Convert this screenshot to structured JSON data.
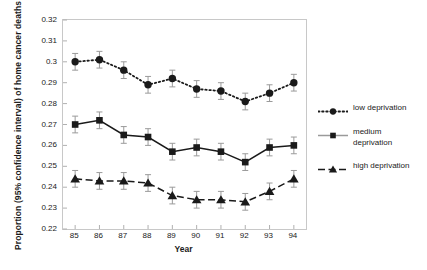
{
  "chart_data": {
    "type": "line",
    "title": "",
    "xlabel": "Year",
    "ylabel": "Proportion (95% confidence interval) of home cancer deaths",
    "categories": [
      "85",
      "86",
      "87",
      "88",
      "89",
      "90",
      "91",
      "92",
      "93",
      "94"
    ],
    "x": [
      85,
      86,
      87,
      88,
      89,
      90,
      91,
      92,
      93,
      94
    ],
    "xlim": [
      84.5,
      94.5
    ],
    "ylim": [
      0.22,
      0.32
    ],
    "yticks": [
      "0.22",
      "0.23",
      "0.24",
      "0.25",
      "0.26",
      "0.27",
      "0.28",
      "0.29",
      "0.3",
      "0.31",
      "0.32"
    ],
    "ytick_values": [
      0.22,
      0.23,
      0.24,
      0.25,
      0.26,
      0.27,
      0.28,
      0.29,
      0.3,
      0.31,
      0.32
    ],
    "grid": false,
    "legend_position": "right",
    "error_bars": "95% confidence interval",
    "series": [
      {
        "name": "low deprivation",
        "marker": "circle",
        "line_style": "dotted",
        "color": "#1a1a1a",
        "values": [
          0.3,
          0.301,
          0.296,
          0.289,
          0.292,
          0.287,
          0.286,
          0.281,
          0.285,
          0.29
        ],
        "err_low": [
          0.296,
          0.297,
          0.292,
          0.285,
          0.288,
          0.283,
          0.282,
          0.277,
          0.281,
          0.286
        ],
        "err_high": [
          0.304,
          0.305,
          0.3,
          0.293,
          0.296,
          0.291,
          0.29,
          0.285,
          0.289,
          0.294
        ]
      },
      {
        "name": "medium deprivation",
        "marker": "square",
        "line_style": "solid",
        "color": "#1a1a1a",
        "values": [
          0.27,
          0.272,
          0.265,
          0.264,
          0.257,
          0.259,
          0.257,
          0.252,
          0.259,
          0.26
        ],
        "err_low": [
          0.266,
          0.268,
          0.261,
          0.26,
          0.253,
          0.255,
          0.253,
          0.248,
          0.255,
          0.256
        ],
        "err_high": [
          0.274,
          0.276,
          0.269,
          0.268,
          0.261,
          0.263,
          0.261,
          0.256,
          0.263,
          0.264
        ]
      },
      {
        "name": "high deprivation",
        "marker": "triangle",
        "line_style": "dashed",
        "color": "#1a1a1a",
        "values": [
          0.244,
          0.243,
          0.243,
          0.242,
          0.236,
          0.234,
          0.234,
          0.233,
          0.238,
          0.244
        ],
        "err_low": [
          0.24,
          0.239,
          0.239,
          0.238,
          0.232,
          0.23,
          0.23,
          0.229,
          0.234,
          0.24
        ],
        "err_high": [
          0.248,
          0.247,
          0.247,
          0.246,
          0.24,
          0.238,
          0.238,
          0.237,
          0.242,
          0.248
        ]
      }
    ]
  },
  "legend": {
    "items": [
      {
        "label": "low deprivation"
      },
      {
        "label": "medium deprivation"
      },
      {
        "label": "high deprivation"
      }
    ]
  }
}
